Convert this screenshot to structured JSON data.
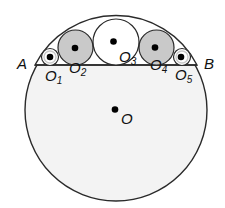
{
  "diagram": {
    "colors": {
      "stroke": "#2a2a2a",
      "big_fill": "#f3f3f3",
      "gray_fill": "#c9c9c9",
      "white_fill": "#ffffff",
      "dot": "#000000"
    },
    "big_circle": {
      "label": "O",
      "cx": 116,
      "cy": 110,
      "r": 91
    },
    "chord": {
      "x1": 35,
      "y1": 65,
      "x2": 197,
      "y2": 65
    },
    "points": {
      "A": {
        "label": "A",
        "x": 17,
        "y": 69
      },
      "B": {
        "label": "B",
        "x": 204,
        "y": 69
      }
    },
    "small_circles": [
      {
        "name": "O1",
        "main": "O",
        "sub": "1",
        "cx": 50,
        "cy": 57,
        "r": 8.5,
        "fill": "white"
      },
      {
        "name": "O2",
        "main": "O",
        "sub": "2",
        "cx": 75.5,
        "cy": 47.5,
        "r": 17.5,
        "fill": "gray"
      },
      {
        "name": "O3",
        "main": "O",
        "sub": "3",
        "cx": 116,
        "cy": 42,
        "r": 23,
        "fill": "white"
      },
      {
        "name": "O4",
        "main": "O",
        "sub": "4",
        "cx": 156.5,
        "cy": 47.5,
        "r": 17.5,
        "fill": "gray"
      },
      {
        "name": "O5",
        "main": "O",
        "sub": "5",
        "cx": 182,
        "cy": 57,
        "r": 8.5,
        "fill": "white"
      }
    ],
    "labels": {
      "A": "A",
      "B": "B",
      "O": "O",
      "O1_main": "O",
      "O1_sub": "1",
      "O2_main": "O",
      "O2_sub": "2",
      "O3_main": "O",
      "O3_sub": "3",
      "O4_main": "O",
      "O4_sub": "4",
      "O5_main": "O",
      "O5_sub": "5"
    }
  }
}
